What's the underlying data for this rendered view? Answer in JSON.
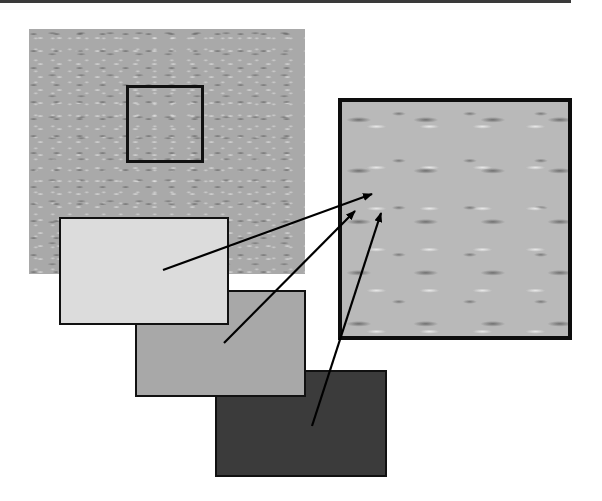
{
  "figure": {
    "type": "texture-magnification-diagram",
    "main_image": {
      "description": "textured wall surface",
      "tone": "#a9a9a9"
    },
    "selection_box": {
      "x": 126,
      "y": 85,
      "w": 78,
      "h": 78
    },
    "zoom_panel": {
      "description": "magnified texture detail",
      "tone": "#b9b9b9"
    },
    "swatches": [
      {
        "name": "light",
        "color": "#dcdcdc"
      },
      {
        "name": "medium",
        "color": "#a8a8a8"
      },
      {
        "name": "dark",
        "color": "#3b3b3b"
      }
    ],
    "arrows": [
      {
        "from": [
          163,
          270
        ],
        "to": [
          372,
          194
        ]
      },
      {
        "from": [
          224,
          343
        ],
        "to": [
          355,
          211
        ]
      },
      {
        "from": [
          312,
          426
        ],
        "to": [
          381,
          213
        ]
      }
    ]
  }
}
